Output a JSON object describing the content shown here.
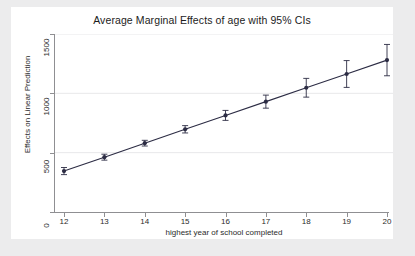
{
  "chart_data": {
    "type": "line",
    "title": "Average Marginal Effects of age with 95% CIs",
    "xlabel": "highest year of school completed",
    "ylabel": "Effects on Linear Prediction",
    "x": [
      12,
      13,
      14,
      15,
      16,
      17,
      18,
      19,
      20
    ],
    "xticklabels": [
      "12",
      "13",
      "14",
      "15",
      "16",
      "17",
      "18",
      "19",
      "20"
    ],
    "yticks": [
      0,
      500,
      1000,
      1500
    ],
    "yticklabels": [
      "0",
      "500",
      "1000",
      "1500"
    ],
    "xlim": [
      12,
      20
    ],
    "ylim": [
      0,
      1500
    ],
    "grid": "horizontal",
    "legend": "none",
    "series": [
      {
        "name": "Average marginal effect of age",
        "values": [
          345,
          462,
          580,
          697,
          814,
          930,
          1047,
          1163,
          1280
        ],
        "ci_low": [
          315,
          437,
          556,
          666,
          772,
          875,
          968,
          1050,
          1148
        ],
        "ci_high": [
          375,
          487,
          604,
          728,
          856,
          985,
          1126,
          1276,
          1412
        ],
        "marker": "filled-circle",
        "color": "#2c2c44"
      }
    ]
  },
  "axes": {
    "y_ticks": [
      {
        "label": "1500",
        "value": 1500
      },
      {
        "label": "1000",
        "value": 1000
      },
      {
        "label": "500",
        "value": 500
      },
      {
        "label": "0",
        "value": 0
      }
    ],
    "x_ticks": [
      {
        "label": "12",
        "value": 12
      },
      {
        "label": "13",
        "value": 13
      },
      {
        "label": "14",
        "value": 14
      },
      {
        "label": "15",
        "value": 15
      },
      {
        "label": "16",
        "value": 16
      },
      {
        "label": "17",
        "value": 17
      },
      {
        "label": "18",
        "value": 18
      },
      {
        "label": "19",
        "value": 19
      },
      {
        "label": "20",
        "value": 20
      }
    ]
  },
  "colors": {
    "background": "#ececed",
    "plot_background": "#ffffff",
    "series": "#2c2c44",
    "axis": "#8f8f92",
    "grid": "#e8e8ea",
    "text": "#1c1c1c"
  }
}
